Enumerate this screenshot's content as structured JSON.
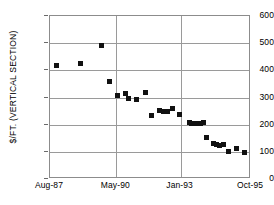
{
  "chart_data": {
    "type": "scatter",
    "title": "",
    "subtitle": "",
    "xlabel": "",
    "ylabel": "$/FT. (VERTICAL SECTION)",
    "grid": true,
    "legend": false,
    "legend_position": "none",
    "marker": "filled-square",
    "marker_color": "#111111",
    "xtick_labels": [
      "Aug-87",
      "May-90",
      "Jan-93",
      "Oct-95"
    ],
    "xtick_positions": [
      0,
      33,
      65,
      100
    ],
    "ytick_labels": [
      "0",
      "100",
      "200",
      "300",
      "400",
      "500",
      "600"
    ],
    "ylim": [
      0,
      600
    ],
    "xlim_labels": [
      "Aug-87",
      "Oct-95"
    ],
    "series": [
      {
        "name": "Cost per foot",
        "points": [
          {
            "xpct": 3.0,
            "y": 418
          },
          {
            "xpct": 15.4,
            "y": 425
          },
          {
            "xpct": 25.4,
            "y": 493
          },
          {
            "xpct": 29.4,
            "y": 358
          },
          {
            "xpct": 33.8,
            "y": 308
          },
          {
            "xpct": 37.8,
            "y": 313
          },
          {
            "xpct": 39.3,
            "y": 297
          },
          {
            "xpct": 42.8,
            "y": 293
          },
          {
            "xpct": 47.3,
            "y": 317
          },
          {
            "xpct": 50.7,
            "y": 235
          },
          {
            "xpct": 54.7,
            "y": 252
          },
          {
            "xpct": 56.7,
            "y": 249
          },
          {
            "xpct": 58.7,
            "y": 247
          },
          {
            "xpct": 60.7,
            "y": 259
          },
          {
            "xpct": 64.2,
            "y": 238
          },
          {
            "xpct": 69.2,
            "y": 207
          },
          {
            "xpct": 70.6,
            "y": 206
          },
          {
            "xpct": 72.1,
            "y": 206
          },
          {
            "xpct": 73.6,
            "y": 205
          },
          {
            "xpct": 75.1,
            "y": 206
          },
          {
            "xpct": 76.6,
            "y": 208
          },
          {
            "xpct": 78.1,
            "y": 152
          },
          {
            "xpct": 81.1,
            "y": 132
          },
          {
            "xpct": 82.6,
            "y": 128
          },
          {
            "xpct": 84.1,
            "y": 122
          },
          {
            "xpct": 86.1,
            "y": 126
          },
          {
            "xpct": 88.6,
            "y": 100
          },
          {
            "xpct": 93.0,
            "y": 112
          },
          {
            "xpct": 97.0,
            "y": 99
          }
        ]
      }
    ]
  }
}
